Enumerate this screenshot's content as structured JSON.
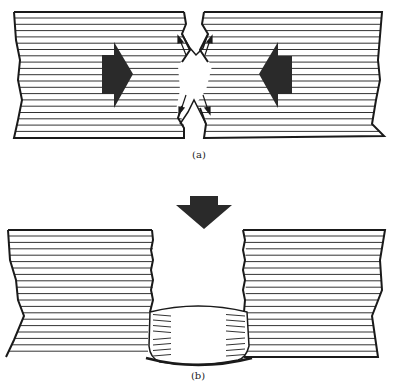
{
  "figure": {
    "panels": [
      {
        "id": "a",
        "caption": "(a)",
        "description": "Two laminated blocks pushed toward each other by large horizontal arrows; material squeezed out at the gap with small diverging arrows",
        "icons": [
          "arrow-right-icon",
          "arrow-left-icon",
          "small-diverging-arrows-icon"
        ]
      },
      {
        "id": "b",
        "caption": "(b)",
        "description": "Downward arrow pressing; two laminated blocks with a compressed bulging region joining them at the bottom",
        "icons": [
          "arrow-down-icon"
        ]
      }
    ],
    "colors": {
      "line": "#1a1a1a",
      "hatch": "#333333",
      "arrow_fill": "#2a2a2a",
      "background": "#ffffff"
    }
  }
}
